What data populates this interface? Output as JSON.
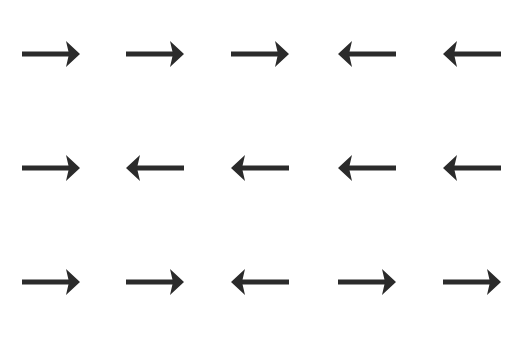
{
  "puzzle": {
    "arrow_color": "#2b2b2b",
    "background": "#ffffff",
    "rows": [
      [
        "right",
        "right",
        "right",
        "left",
        "left"
      ],
      [
        "right",
        "left",
        "left",
        "left",
        "left"
      ],
      [
        "right",
        "right",
        "left",
        "right",
        "right"
      ]
    ]
  }
}
